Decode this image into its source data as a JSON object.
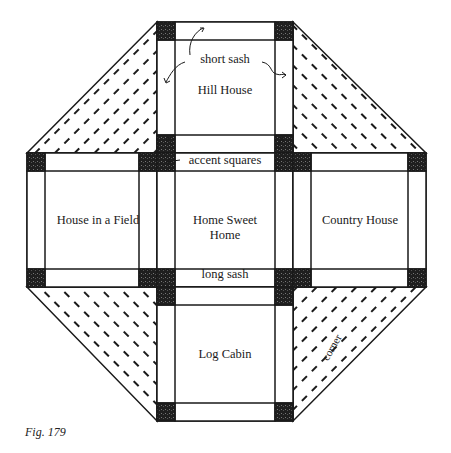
{
  "figure": {
    "caption": "Fig. 179"
  },
  "blocks": {
    "top": "Hill House",
    "left": "House in a Field",
    "center_line1": "Home Sweet",
    "center_line2": "Home",
    "right": "Country House",
    "bottom": "Log Cabin"
  },
  "annotations": {
    "short_sash": "short sash",
    "accent_squares": "accent squares",
    "long_sash": "long sash",
    "corner": "corner"
  },
  "colors": {
    "line": "#1a1a1a",
    "accent": "#2a2a2a",
    "background": "#ffffff"
  }
}
